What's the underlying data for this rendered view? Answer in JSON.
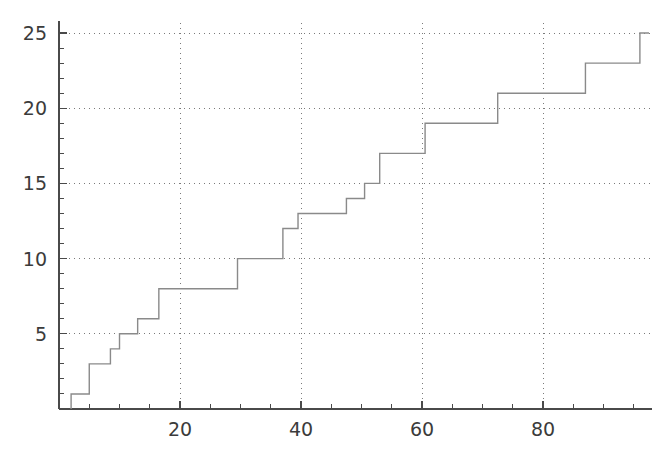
{
  "chart_data": {
    "type": "line",
    "subtype": "step-post",
    "title": "",
    "subtitle": "",
    "xlabel": "",
    "ylabel": "",
    "xlim": [
      0,
      98
    ],
    "ylim": [
      0,
      25.8
    ],
    "grid": true,
    "grid_style": "dotted",
    "legend": null,
    "legend_position": "none",
    "x_ticks_major": [
      20,
      40,
      60,
      80
    ],
    "x_tick_labels": [
      "20",
      "40",
      "60",
      "80"
    ],
    "x_ticks_minor": [
      5,
      10,
      15,
      25,
      30,
      35,
      45,
      50,
      55,
      65,
      70,
      75,
      85,
      90,
      95
    ],
    "y_ticks_major": [
      5,
      10,
      15,
      20,
      25
    ],
    "y_tick_labels": [
      "5",
      "10",
      "15",
      "20",
      "25"
    ],
    "y_ticks_minor": [
      1,
      2,
      3,
      4,
      6,
      7,
      8,
      9,
      11,
      12,
      13,
      14,
      16,
      17,
      18,
      19,
      21,
      22,
      23,
      24
    ],
    "series": [
      {
        "name": "cumulative-count",
        "color": "#8a8a8a",
        "x": [
          2.0,
          5.0,
          8.5,
          10.0,
          13.0,
          16.5,
          29.5,
          37.0,
          39.5,
          47.5,
          50.5,
          53.0,
          60.5,
          72.5,
          87.0,
          96.0,
          97.5
        ],
        "y": [
          1,
          3,
          4,
          5,
          6,
          8,
          10,
          12,
          13,
          14,
          15,
          17,
          19,
          21,
          23,
          25,
          25
        ]
      }
    ]
  },
  "axes": {
    "x_axis_name": "x-axis",
    "y_axis_name": "y-axis"
  }
}
